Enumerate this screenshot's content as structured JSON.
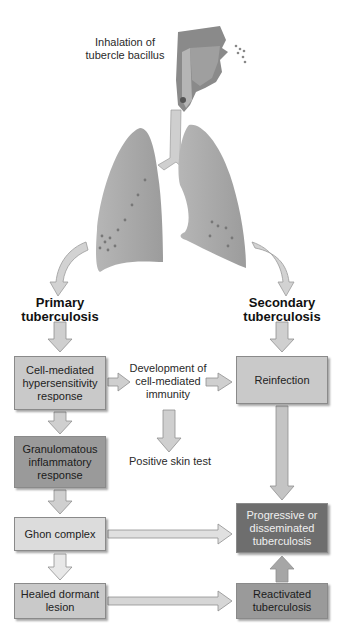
{
  "title_label": "Inhalation of tubercle bacillus",
  "title_lines": [
    "Inhalation of",
    "tubercle bacillus"
  ],
  "primary": {
    "lines": [
      "Primary",
      "tuberculosis"
    ]
  },
  "secondary": {
    "lines": [
      "Secondary",
      "tuberculosis"
    ]
  },
  "boxes": {
    "cell_mediated": "Cell-mediated hypersensitivity response",
    "granulomatous": "Granulomatous inflammatory response",
    "ghon": "Ghon complex",
    "healed": "Healed dormant lesion",
    "reinfection": "Reinfection",
    "progressive": "Progressive or disseminated tuberculosis",
    "reactivated": "Reactivated tuberculosis"
  },
  "middle": {
    "development": "Development of cell-mediated immunity",
    "skin_test": "Positive skin test"
  },
  "colors": {
    "light_box": "#c9c9c9",
    "lighter_box": "#dcdcdc",
    "mid_box": "#9a9a9a",
    "dark_box": "#6e6e6e",
    "lung": "#a8a8a8",
    "arrow": "#c4c4c4"
  }
}
